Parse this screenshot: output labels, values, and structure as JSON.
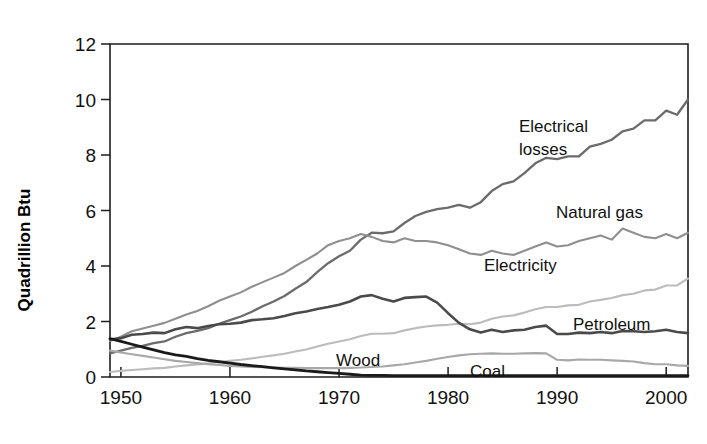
{
  "chart_data": {
    "type": "line",
    "title": "",
    "subtitle": "",
    "xlabel": "",
    "ylabel": "Quadrillion Btu",
    "xlim": [
      1949,
      2002
    ],
    "ylim": [
      0,
      12
    ],
    "grid": false,
    "legend_position": "inline-annotations",
    "y_ticks": [
      0,
      2,
      4,
      6,
      8,
      10,
      12
    ],
    "y_tick_labels": [
      "0",
      "2",
      "4",
      "6",
      "8",
      "10",
      "12"
    ],
    "x_ticks": [
      1950,
      1960,
      1970,
      1980,
      1990,
      2000
    ],
    "x_tick_labels": [
      "1950",
      "1960",
      "1970",
      "1980",
      "1990",
      "2000"
    ],
    "x": [
      1949,
      1950,
      1951,
      1952,
      1953,
      1954,
      1955,
      1956,
      1957,
      1958,
      1959,
      1960,
      1961,
      1962,
      1963,
      1964,
      1965,
      1966,
      1967,
      1968,
      1969,
      1970,
      1971,
      1972,
      1973,
      1974,
      1975,
      1976,
      1977,
      1978,
      1979,
      1980,
      1981,
      1982,
      1983,
      1984,
      1985,
      1986,
      1987,
      1988,
      1989,
      1990,
      1991,
      1992,
      1993,
      1994,
      1995,
      1996,
      1997,
      1998,
      1999,
      2000,
      2001,
      2002
    ],
    "series": [
      {
        "name": "Electrical losses",
        "color": "#6b6b6b",
        "width": 2.3,
        "label_x": 2.9,
        "values": [
          0.85,
          0.95,
          1.05,
          1.12,
          1.22,
          1.28,
          1.45,
          1.58,
          1.66,
          1.76,
          1.92,
          2.05,
          2.18,
          2.35,
          2.55,
          2.72,
          2.92,
          3.18,
          3.42,
          3.78,
          4.1,
          4.35,
          4.55,
          4.95,
          5.2,
          5.18,
          5.25,
          5.55,
          5.8,
          5.95,
          6.05,
          6.1,
          6.2,
          6.1,
          6.3,
          6.7,
          6.95,
          7.05,
          7.35,
          7.7,
          7.9,
          7.85,
          7.95,
          7.95,
          8.3,
          8.4,
          8.55,
          8.85,
          8.95,
          9.25,
          9.25,
          9.6,
          9.45,
          10.0
        ]
      },
      {
        "name": "Natural gas",
        "color": "#8f8f8f",
        "width": 2.1,
        "label_x": 1993,
        "values": [
          1.3,
          1.45,
          1.65,
          1.75,
          1.85,
          1.95,
          2.1,
          2.25,
          2.38,
          2.55,
          2.75,
          2.9,
          3.05,
          3.25,
          3.42,
          3.58,
          3.75,
          4.0,
          4.22,
          4.45,
          4.75,
          4.9,
          5.0,
          5.15,
          5.05,
          4.9,
          4.85,
          5.0,
          4.9,
          4.9,
          4.85,
          4.75,
          4.6,
          4.45,
          4.4,
          4.55,
          4.45,
          4.4,
          4.55,
          4.7,
          4.85,
          4.7,
          4.75,
          4.9,
          5.0,
          5.1,
          4.95,
          5.35,
          5.2,
          5.05,
          5.0,
          5.15,
          5.0,
          5.2
        ]
      },
      {
        "name": "Electricity",
        "color": "#bcbcbc",
        "width": 2.1,
        "label_x": 1987,
        "values": [
          0.18,
          0.22,
          0.25,
          0.28,
          0.31,
          0.33,
          0.38,
          0.42,
          0.45,
          0.49,
          0.54,
          0.58,
          0.62,
          0.67,
          0.73,
          0.78,
          0.84,
          0.92,
          0.99,
          1.1,
          1.2,
          1.28,
          1.36,
          1.48,
          1.56,
          1.56,
          1.58,
          1.68,
          1.76,
          1.82,
          1.86,
          1.88,
          1.92,
          1.9,
          1.96,
          2.1,
          2.18,
          2.22,
          2.32,
          2.44,
          2.52,
          2.52,
          2.58,
          2.6,
          2.72,
          2.78,
          2.85,
          2.95,
          3.0,
          3.12,
          3.15,
          3.3,
          3.3,
          3.55
        ]
      },
      {
        "name": "Petroleum",
        "color": "#4a4a4a",
        "width": 2.6,
        "label_x": 1994,
        "values": [
          1.35,
          1.4,
          1.52,
          1.55,
          1.6,
          1.58,
          1.72,
          1.8,
          1.76,
          1.84,
          1.9,
          1.92,
          1.96,
          2.05,
          2.08,
          2.12,
          2.2,
          2.3,
          2.36,
          2.45,
          2.52,
          2.6,
          2.72,
          2.9,
          2.95,
          2.82,
          2.72,
          2.85,
          2.88,
          2.9,
          2.68,
          2.3,
          1.95,
          1.72,
          1.6,
          1.7,
          1.62,
          1.68,
          1.7,
          1.8,
          1.85,
          1.55,
          1.55,
          1.6,
          1.58,
          1.62,
          1.58,
          1.66,
          1.65,
          1.62,
          1.65,
          1.7,
          1.62,
          1.58
        ]
      },
      {
        "name": "Wood",
        "color": "#a8a8a8",
        "width": 2.1,
        "label_x": 1974,
        "values": [
          0.95,
          0.88,
          0.82,
          0.76,
          0.7,
          0.64,
          0.58,
          0.54,
          0.5,
          0.46,
          0.43,
          0.4,
          0.38,
          0.36,
          0.35,
          0.34,
          0.33,
          0.33,
          0.32,
          0.32,
          0.32,
          0.32,
          0.33,
          0.34,
          0.36,
          0.38,
          0.42,
          0.46,
          0.52,
          0.58,
          0.66,
          0.72,
          0.78,
          0.82,
          0.84,
          0.85,
          0.84,
          0.84,
          0.85,
          0.86,
          0.85,
          0.62,
          0.6,
          0.63,
          0.62,
          0.62,
          0.6,
          0.58,
          0.56,
          0.5,
          0.46,
          0.46,
          0.42,
          0.4
        ]
      },
      {
        "name": "Coal",
        "color": "#1a1a1a",
        "width": 2.8,
        "label_x": 1984,
        "values": [
          1.38,
          1.28,
          1.18,
          1.08,
          0.98,
          0.88,
          0.8,
          0.74,
          0.66,
          0.6,
          0.55,
          0.5,
          0.45,
          0.41,
          0.37,
          0.33,
          0.29,
          0.26,
          0.22,
          0.19,
          0.16,
          0.13,
          0.1,
          0.07,
          0.06,
          0.06,
          0.05,
          0.05,
          0.05,
          0.05,
          0.05,
          0.05,
          0.05,
          0.05,
          0.05,
          0.05,
          0.05,
          0.05,
          0.05,
          0.05,
          0.05,
          0.05,
          0.05,
          0.05,
          0.05,
          0.05,
          0.05,
          0.05,
          0.05,
          0.05,
          0.05,
          0.05,
          0.05,
          0.05
        ]
      }
    ],
    "annotations": [
      {
        "text": "Electrical",
        "x_px": 519,
        "y_px": 132
      },
      {
        "text": "losses",
        "x_px": 519,
        "y_px": 155
      },
      {
        "text": "Natural gas",
        "x_px": 556,
        "y_px": 218
      },
      {
        "text": "Electricity",
        "x_px": 484,
        "y_px": 271
      },
      {
        "text": "Petroleum",
        "x_px": 573,
        "y_px": 330
      },
      {
        "text": "Wood",
        "x_px": 336,
        "y_px": 366
      },
      {
        "text": "Coal",
        "x_px": 470,
        "y_px": 377
      }
    ]
  },
  "axes": {
    "y_axis_title": "Quadrillion Btu"
  }
}
